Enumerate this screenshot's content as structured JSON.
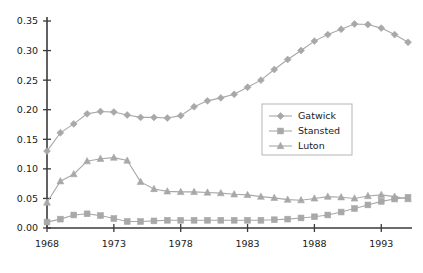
{
  "chart_data": {
    "type": "line",
    "title": "",
    "xlabel": "",
    "ylabel": "",
    "xlim": [
      1968,
      1995
    ],
    "ylim": [
      0.0,
      0.35
    ],
    "grid": false,
    "legend_position": "upper-right-inside",
    "xticks": [
      1968,
      1973,
      1978,
      1983,
      1988,
      1993
    ],
    "xtick_labels": [
      "1968",
      "1973",
      "1978",
      "1983",
      "1988",
      "1993"
    ],
    "yticks": [
      0.0,
      0.05,
      0.1,
      0.15,
      0.2,
      0.25,
      0.3,
      0.35
    ],
    "ytick_labels": [
      "0.00",
      "0.05",
      "0.10",
      "0.15",
      "0.20",
      "0.25",
      "0.30",
      "0.35"
    ],
    "x": [
      1968,
      1969,
      1970,
      1971,
      1972,
      1973,
      1974,
      1975,
      1976,
      1977,
      1978,
      1979,
      1980,
      1981,
      1982,
      1983,
      1984,
      1985,
      1986,
      1987,
      1988,
      1989,
      1990,
      1991,
      1992,
      1993,
      1994,
      1995
    ],
    "series": [
      {
        "name": "Gatwick",
        "marker": "diamond",
        "color": "#a8a8a8",
        "values": [
          0.13,
          0.161,
          0.176,
          0.193,
          0.197,
          0.196,
          0.191,
          0.187,
          0.187,
          0.186,
          0.19,
          0.205,
          0.215,
          0.22,
          0.226,
          0.238,
          0.25,
          0.268,
          0.285,
          0.3,
          0.316,
          0.327,
          0.336,
          0.345,
          0.344,
          0.338,
          0.327,
          0.314
        ]
      },
      {
        "name": "Stansted",
        "marker": "square",
        "color": "#a8a8a8",
        "values": [
          0.01,
          0.015,
          0.022,
          0.024,
          0.021,
          0.016,
          0.011,
          0.011,
          0.012,
          0.013,
          0.013,
          0.013,
          0.013,
          0.013,
          0.013,
          0.013,
          0.013,
          0.014,
          0.015,
          0.017,
          0.019,
          0.022,
          0.027,
          0.033,
          0.039,
          0.045,
          0.049,
          0.052
        ]
      },
      {
        "name": "Luton",
        "marker": "triangle",
        "color": "#a8a8a8",
        "values": [
          0.043,
          0.079,
          0.091,
          0.113,
          0.117,
          0.119,
          0.114,
          0.078,
          0.066,
          0.062,
          0.061,
          0.061,
          0.06,
          0.059,
          0.057,
          0.056,
          0.053,
          0.051,
          0.048,
          0.047,
          0.05,
          0.053,
          0.052,
          0.05,
          0.054,
          0.056,
          0.053,
          0.049
        ]
      }
    ]
  },
  "legend": {
    "entries": [
      {
        "label": "Gatwick"
      },
      {
        "label": "Stansted"
      },
      {
        "label": "Luton"
      }
    ]
  },
  "colors": {
    "series": "#a8a8a8",
    "axis": "#3a3a3a",
    "text": "#1a1a1a",
    "legend_border": "#b5b5b5",
    "background": "#ffffff"
  }
}
